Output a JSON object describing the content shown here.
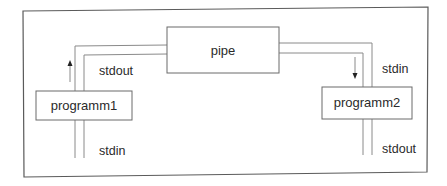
{
  "diagram": {
    "type": "pipe-dataflow",
    "nodes": {
      "pipe": {
        "label": "pipe"
      },
      "programm1": {
        "label": "programm1"
      },
      "programm2": {
        "label": "programm2"
      }
    },
    "labels": {
      "p1_top": "stdout",
      "p1_bottom": "stdin",
      "p2_top": "stdin",
      "p2_bottom": "stdout"
    },
    "arrows": {
      "left": "up",
      "right": "down"
    },
    "edges": [
      {
        "from": "programm1",
        "to": "pipe",
        "label": "stdout",
        "direction": "up"
      },
      {
        "from": "pipe",
        "to": "programm2",
        "label": "stdin",
        "direction": "down"
      }
    ],
    "colors": {
      "line": "#6e6e6e",
      "frame": "#555555",
      "text": "#2a2a2a"
    }
  }
}
